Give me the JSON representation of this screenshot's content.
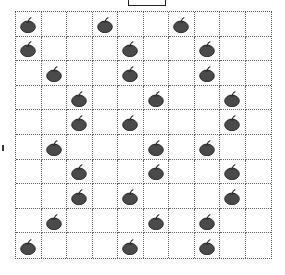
{
  "grid": {
    "rows": 10,
    "cols": 10,
    "apple_color": "#4a4a4a",
    "apples": [
      [
        1,
        4,
        7
      ],
      [
        1,
        5,
        8
      ],
      [
        2,
        5,
        8
      ],
      [
        3,
        6,
        9
      ],
      [
        3,
        5,
        9
      ],
      [
        2,
        6,
        8
      ],
      [
        3,
        6,
        9
      ],
      [
        3,
        5,
        9
      ],
      [
        2,
        6,
        8
      ],
      [
        1,
        5,
        8
      ]
    ]
  }
}
